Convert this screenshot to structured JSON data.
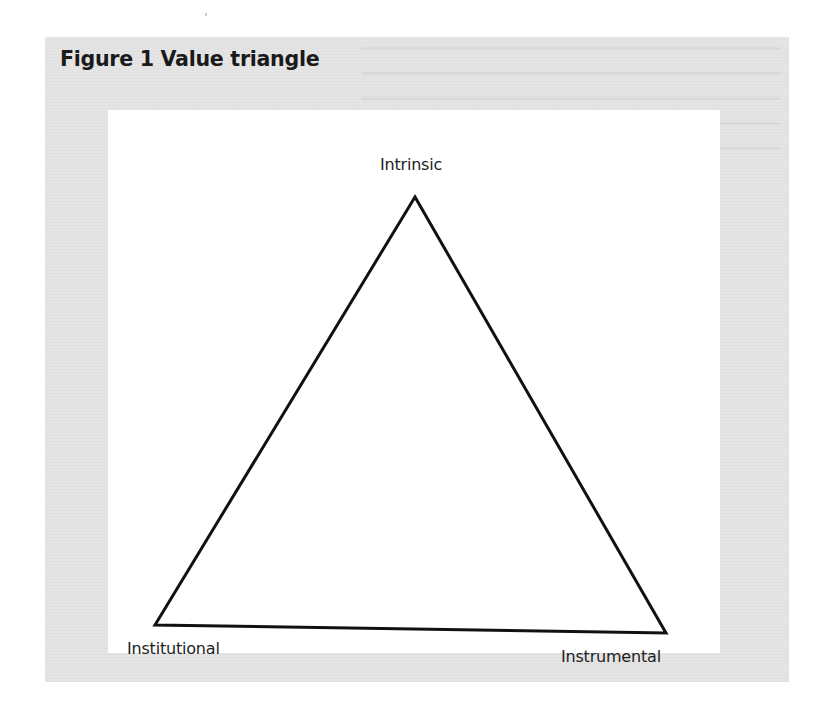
{
  "figure": {
    "title": "Figure 1 Value triangle",
    "background_color": "#e4e4e4",
    "canvas_color": "#ffffff",
    "line_color": "#111111"
  },
  "diagram": {
    "type": "triangle",
    "vertices": [
      {
        "id": "top",
        "label": "Intrinsic"
      },
      {
        "id": "bottom-left",
        "label": "Institutional"
      },
      {
        "id": "bottom-right",
        "label": "Instrumental"
      }
    ]
  }
}
